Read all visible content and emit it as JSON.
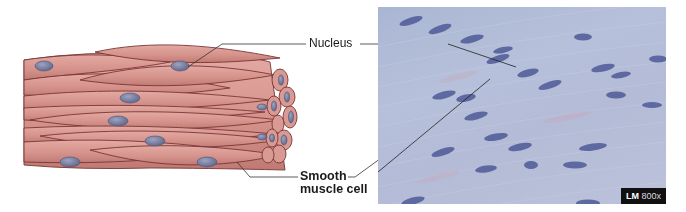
{
  "labels": {
    "nucleus": "Nucleus",
    "smooth_muscle_line1": "Smooth",
    "smooth_muscle_line2": "muscle cell"
  },
  "micrograph": {
    "badge_type": "LM",
    "badge_magnification": "800x"
  },
  "colors": {
    "cell_fill": "#d99a93",
    "cell_outline": "#7a3434",
    "nucleus_fill": "#6e7396",
    "micrograph_bg": "#b3bbd6",
    "micro_nucleus": "#4a5593",
    "leader_line": "#333333"
  }
}
